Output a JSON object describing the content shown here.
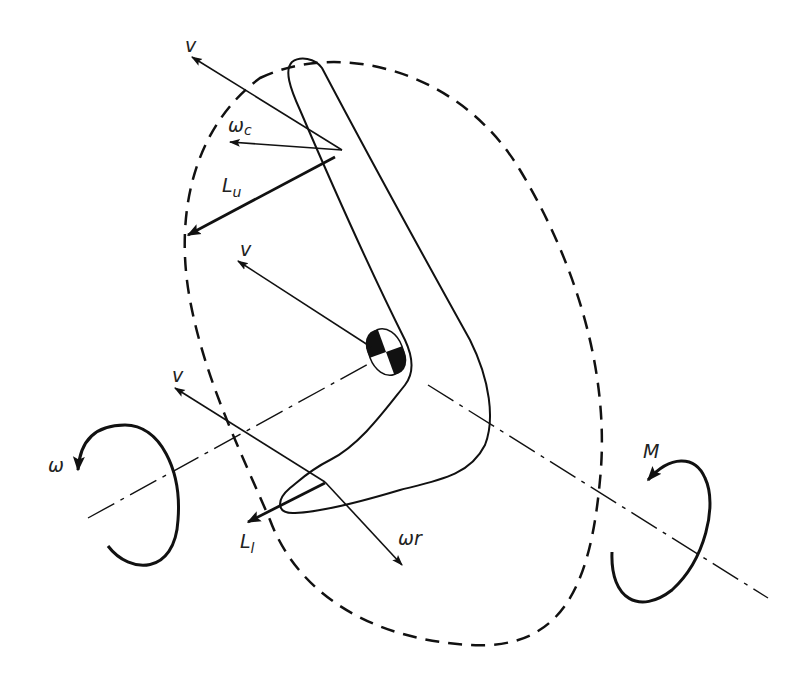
{
  "diagram": {
    "colors": {
      "ink": "#111111",
      "background": "#ffffff"
    },
    "labels": {
      "v_top": "v",
      "omega_c": "ω",
      "omega_c_sub": "c",
      "L_u": "L",
      "L_u_sub": "u",
      "v_center": "v",
      "v_lower": "v",
      "omega_spin": "ω",
      "L_l": "L",
      "L_l_sub": "l",
      "omega_r": "ωr",
      "M": "M"
    },
    "elements": [
      "boomerang-outline",
      "center-of-mass-marker",
      "dashed-rotation-ellipse",
      "dash-dot-spin-axis",
      "spin-rotation-arrow-omega",
      "precession-moment-arrow-M",
      "velocity-vectors-v",
      "lift-vectors-Lu-Ll",
      "rotational-velocity-vectors"
    ]
  }
}
